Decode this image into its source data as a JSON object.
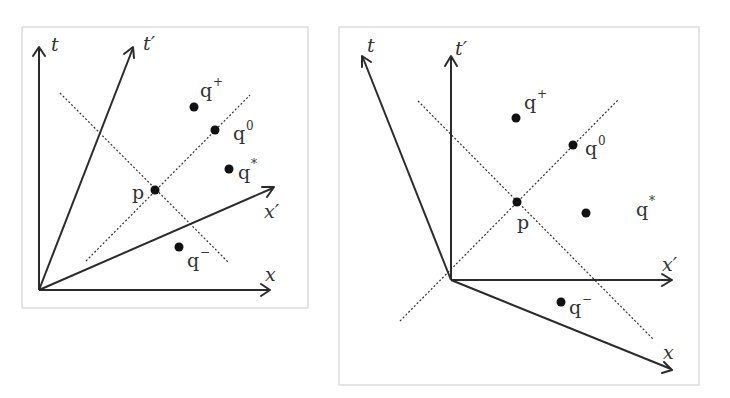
{
  "figure": {
    "panels": [
      {
        "id": "left",
        "description": "Spacetime diagram with primed axes rotated toward the light cone (both t' and x' inside first quadrant)",
        "axes": {
          "t": {
            "label": "t"
          },
          "t_prime": {
            "label": "t′"
          },
          "x": {
            "label": "x"
          },
          "x_prime": {
            "label": "x′"
          }
        },
        "points": {
          "p": {
            "label": "p"
          },
          "q_plus": {
            "base": "q",
            "sup": "+"
          },
          "q_zero": {
            "base": "q",
            "sup": "0"
          },
          "q_star": {
            "base": "q",
            "sup": "*"
          },
          "q_minus": {
            "base": "q",
            "sup": "−"
          }
        }
      },
      {
        "id": "right",
        "description": "Spacetime diagram with unprimed axes drawn skewed outward and primed axes orthogonal",
        "axes": {
          "t": {
            "label": "t"
          },
          "t_prime": {
            "label": "t′"
          },
          "x": {
            "label": "x"
          },
          "x_prime": {
            "label": "x′"
          }
        },
        "points": {
          "p": {
            "label": "p"
          },
          "q_plus": {
            "base": "q",
            "sup": "+"
          },
          "q_zero": {
            "base": "q",
            "sup": "0"
          },
          "q_star": {
            "base": "q",
            "sup": "*"
          },
          "q_minus": {
            "base": "q",
            "sup": "−"
          }
        }
      }
    ]
  }
}
